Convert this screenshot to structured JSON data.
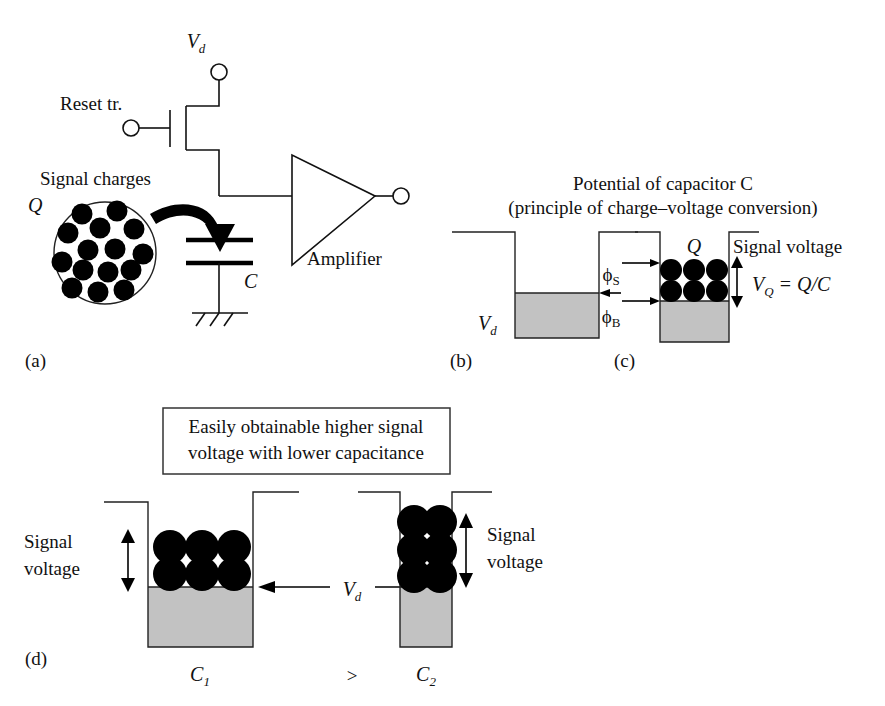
{
  "figure": {
    "title_none": "",
    "panels": {
      "a": "(a)",
      "b": "(b)",
      "c": "(c)",
      "d": "(d)"
    }
  },
  "circuit": {
    "vd_label": "V",
    "vd_sub": "d",
    "reset_label": "Reset tr.",
    "signal_charges_label": "Signal charges",
    "q_label": "Q",
    "capacitor_label": "C",
    "amplifier_label": "Amplifier",
    "charge_dot_count": 15
  },
  "potential": {
    "title_line1": "Potential of capacitor C",
    "title_line2": "(principle of charge–voltage conversion)",
    "panel_b": {
      "vd_label": "V",
      "vd_sub": "d"
    },
    "panel_c": {
      "q_label": "Q",
      "signal_voltage_label": "Signal voltage",
      "phi_s_label": "ϕ",
      "phi_s_sub": "S",
      "phi_b_label": "ϕ",
      "phi_b_sub": "B",
      "vq_label": "V",
      "vq_sub": "Q",
      "vq_expr": " = Q/C",
      "dot_rows": 2,
      "dot_cols": 3
    }
  },
  "comparison": {
    "callout_line1": "Easily obtainable higher signal",
    "callout_line2": "voltage with lower capacitance",
    "left_well": {
      "cap_label": "C",
      "cap_sub": "1",
      "signal_line1": "Signal",
      "signal_line2": "voltage",
      "dot_rows": 2,
      "dot_cols": 3
    },
    "right_well": {
      "cap_label": "C",
      "cap_sub": "2",
      "signal_line1": "Signal",
      "signal_line2": "voltage",
      "dot_rows": 3,
      "dot_cols": 2
    },
    "vd_label": "V",
    "vd_sub": "d",
    "relation_symbol": ">"
  },
  "colors": {
    "ink": "#111111",
    "well_fill": "#c2c2c2",
    "background": "#ffffff",
    "dot": "#000000"
  }
}
